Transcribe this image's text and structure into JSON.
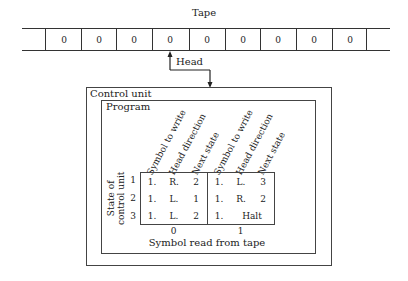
{
  "tape": {
    "title": "Tape",
    "cells": [
      "0",
      "0",
      "0",
      "0",
      "0",
      "0",
      "0",
      "0",
      "0"
    ]
  },
  "head": {
    "label": "Head"
  },
  "control_unit": {
    "label": "Control unit",
    "program": {
      "label": "Program",
      "column_headers": [
        "Symbol to write",
        "Head direction",
        "Next state",
        "Symbol to write",
        "Head direction",
        "Next state"
      ],
      "row_axis_label_line1": "State of",
      "row_axis_label_line2": "control unit",
      "states": [
        "1",
        "2",
        "3"
      ],
      "rows": [
        {
          "state": "1",
          "read0": {
            "write": "1.",
            "dir": "R.",
            "next": "2"
          },
          "read1": {
            "write": "1.",
            "dir": "L.",
            "next": "3"
          }
        },
        {
          "state": "2",
          "read0": {
            "write": "1.",
            "dir": "L.",
            "next": "1"
          },
          "read1": {
            "write": "1.",
            "dir": "R.",
            "next": "2"
          }
        },
        {
          "state": "3",
          "read0": {
            "write": "1.",
            "dir": "L.",
            "next": "2"
          },
          "read1": {
            "write": "1.",
            "halt": "Halt"
          }
        }
      ],
      "symbols_read": [
        "0",
        "1"
      ],
      "column_axis_label": "Symbol read from tape"
    }
  }
}
